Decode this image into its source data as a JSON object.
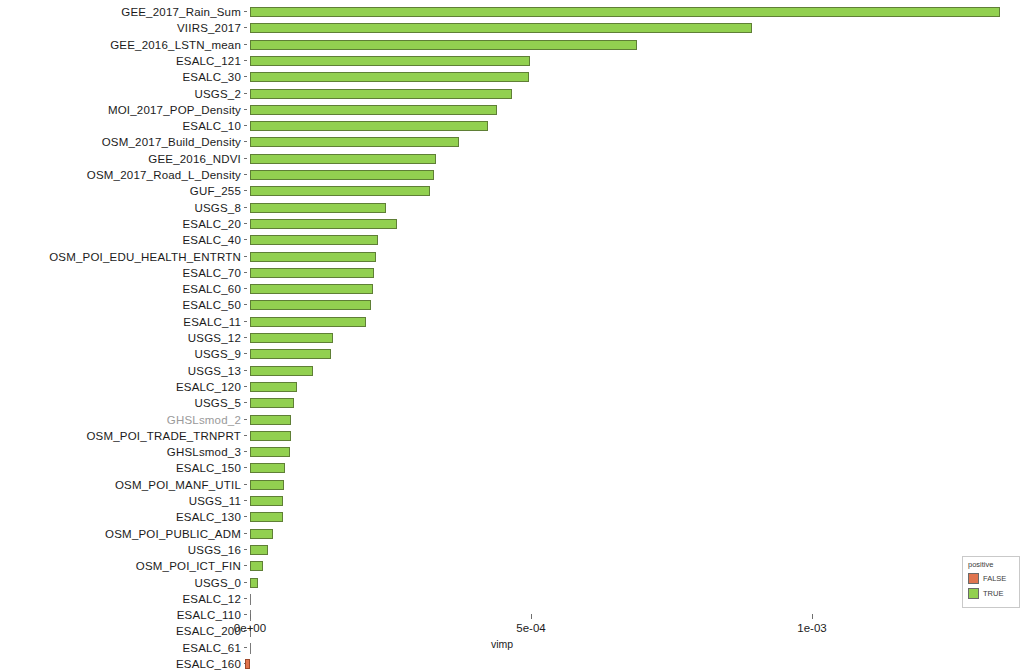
{
  "chart_data": {
    "type": "bar",
    "orientation": "horizontal",
    "title": "",
    "xlabel": "vimp",
    "ylabel": "",
    "xlim": [
      0,
      0.00134
    ],
    "xticks": [
      0,
      0.0005,
      0.001
    ],
    "xticklabels": [
      "0e+00",
      "5e-04",
      "1e-03"
    ],
    "grid": false,
    "legend": {
      "title": "positive",
      "position": "right-bottom",
      "entries": [
        {
          "label": "FALSE",
          "color": "#e0744f"
        },
        {
          "label": "TRUE",
          "color": "#92d050"
        }
      ]
    },
    "colors": {
      "true": "#92d050",
      "false": "#e0744f",
      "bar_outline": "#5f7f36"
    },
    "categories": [
      "GEE_2017_Rain_Sum",
      "VIIRS_2017",
      "GEE_2016_LSTN_mean",
      "ESALC_121",
      "ESALC_30",
      "USGS_2",
      "MOI_2017_POP_Density",
      "ESALC_10",
      "OSM_2017_Build_Density",
      "GEE_2016_NDVI",
      "OSM_2017_Road_L_Density",
      "GUF_255",
      "USGS_8",
      "ESALC_20",
      "ESALC_40",
      "OSM_POI_EDU_HEALTH_ENTRTN",
      "ESALC_70",
      "ESALC_60",
      "ESALC_50",
      "ESALC_11",
      "USGS_12",
      "USGS_9",
      "USGS_13",
      "ESALC_120",
      "USGS_5",
      "GHSLsmod_2",
      "OSM_POI_TRADE_TRNPRT",
      "GHSLsmod_3",
      "ESALC_150",
      "OSM_POI_MANF_UTIL",
      "USGS_11",
      "ESALC_130",
      "OSM_POI_PUBLIC_ADM",
      "USGS_16",
      "OSM_POI_ICT_FIN",
      "USGS_0",
      "ESALC_12",
      "ESALC_110",
      "ESALC_200",
      "ESALC_61",
      "ESALC_160"
    ],
    "values": [
      0.001335,
      0.000893,
      0.000689,
      0.000498,
      0.000496,
      0.000466,
      0.000439,
      0.000423,
      0.000371,
      0.000331,
      0.000327,
      0.00032,
      0.000242,
      0.000261,
      0.000227,
      0.000224,
      0.00022,
      0.000218,
      0.000215,
      0.000206,
      0.000148,
      0.000145,
      0.000112,
      8.4e-05,
      7.8e-05,
      7.3e-05,
      7.3e-05,
      7.1e-05,
      6.2e-05,
      6e-05,
      5.9e-05,
      5.9e-05,
      4.1e-05,
      3.2e-05,
      2.3e-05,
      1.4e-05,
      0.0,
      0.0,
      0.0,
      0.0,
      -7e-06
    ],
    "positive": [
      true,
      true,
      true,
      true,
      true,
      true,
      true,
      true,
      true,
      true,
      true,
      true,
      true,
      true,
      true,
      true,
      true,
      true,
      true,
      true,
      true,
      true,
      true,
      true,
      true,
      true,
      true,
      true,
      true,
      true,
      true,
      true,
      true,
      true,
      true,
      true,
      true,
      true,
      true,
      true,
      false
    ],
    "muted_labels": [
      "GHSLsmod_2"
    ]
  }
}
